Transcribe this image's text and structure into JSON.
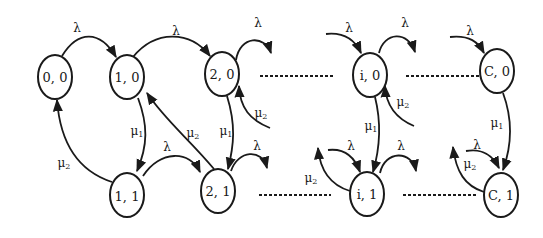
{
  "diagram": {
    "type": "state-transition-diagram",
    "states": [
      {
        "id": "s00",
        "label": "0, 0"
      },
      {
        "id": "s10",
        "label": "1, 0"
      },
      {
        "id": "s11",
        "label": "1, 1"
      },
      {
        "id": "s20",
        "label": "2, 0"
      },
      {
        "id": "s21",
        "label": "2, 1"
      },
      {
        "id": "si0",
        "label": "i, 0"
      },
      {
        "id": "si1",
        "label": "i, 1"
      },
      {
        "id": "sC0",
        "label": "C, 0"
      },
      {
        "id": "sC1",
        "label": "C, 1"
      }
    ],
    "rates": {
      "lambda": "λ",
      "mu": "μ",
      "mu1_sub": "1",
      "mu2_sub": "2"
    },
    "transitions": [
      {
        "from": "0, 0",
        "to": "1, 0",
        "rate": "λ"
      },
      {
        "from": "1, 0",
        "to": "2, 0",
        "rate": "λ"
      },
      {
        "from": "2, 0",
        "to": "...",
        "rate": "λ"
      },
      {
        "from": "1, 0",
        "to": "1, 1",
        "rate": "μ1"
      },
      {
        "from": "1, 1",
        "to": "0, 0",
        "rate": "μ2"
      },
      {
        "from": "1, 1",
        "to": "2, 1",
        "rate": "λ"
      },
      {
        "from": "2, 1",
        "to": "1, 0",
        "rate": "μ2"
      },
      {
        "from": "2, 0",
        "to": "2, 1",
        "rate": "μ1"
      },
      {
        "from": "...",
        "to": "2, 0",
        "rate": "μ2"
      },
      {
        "from": "2, 1",
        "to": "...",
        "rate": "λ"
      },
      {
        "from": "...",
        "to": "i, 0",
        "rate": "λ"
      },
      {
        "from": "i, 0",
        "to": "...",
        "rate": "λ"
      },
      {
        "from": "...",
        "to": "i, 0",
        "rate": "μ2"
      },
      {
        "from": "i, 0",
        "to": "i, 1",
        "rate": "μ1"
      },
      {
        "from": "...",
        "to": "i, 1",
        "rate": "λ"
      },
      {
        "from": "i, 1",
        "to": "...",
        "rate": "λ"
      },
      {
        "from": "i, 1",
        "to": "...",
        "rate": "μ2"
      },
      {
        "from": "...",
        "to": "C, 0",
        "rate": "λ"
      },
      {
        "from": "C, 0",
        "to": "C, 1",
        "rate": "μ1"
      },
      {
        "from": "...",
        "to": "C, 1",
        "rate": "λ"
      },
      {
        "from": "C, 1",
        "to": "...",
        "rate": "μ2"
      }
    ]
  }
}
